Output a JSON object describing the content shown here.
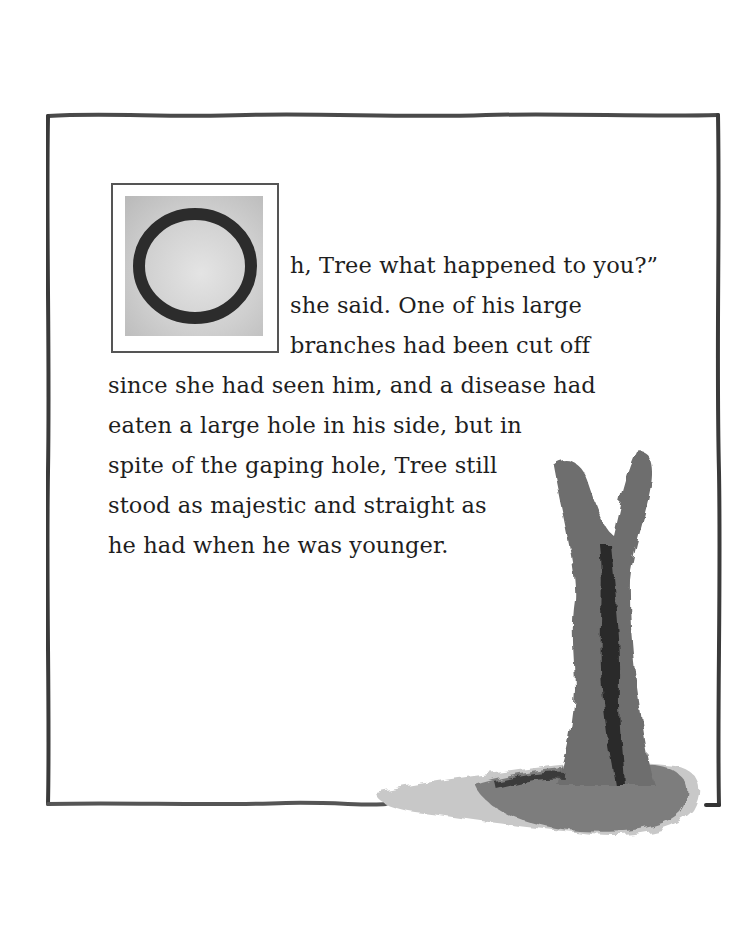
{
  "page": {
    "drop_cap": "O",
    "lines": [
      "h, Tree what happened to you?”",
      "she said. One of his large",
      "branches had been cut off",
      "since she had seen him, and a disease had",
      "eaten a large hole in his side, but in",
      "spite of the gaping hole, Tree still",
      "stood as majestic and straight as",
      "he had when he was younger."
    ]
  },
  "illustration": {
    "subject": "tree-trunk-watercolor",
    "ink_color": "#3a3a3a",
    "wash_color": "#8a8a8a"
  }
}
